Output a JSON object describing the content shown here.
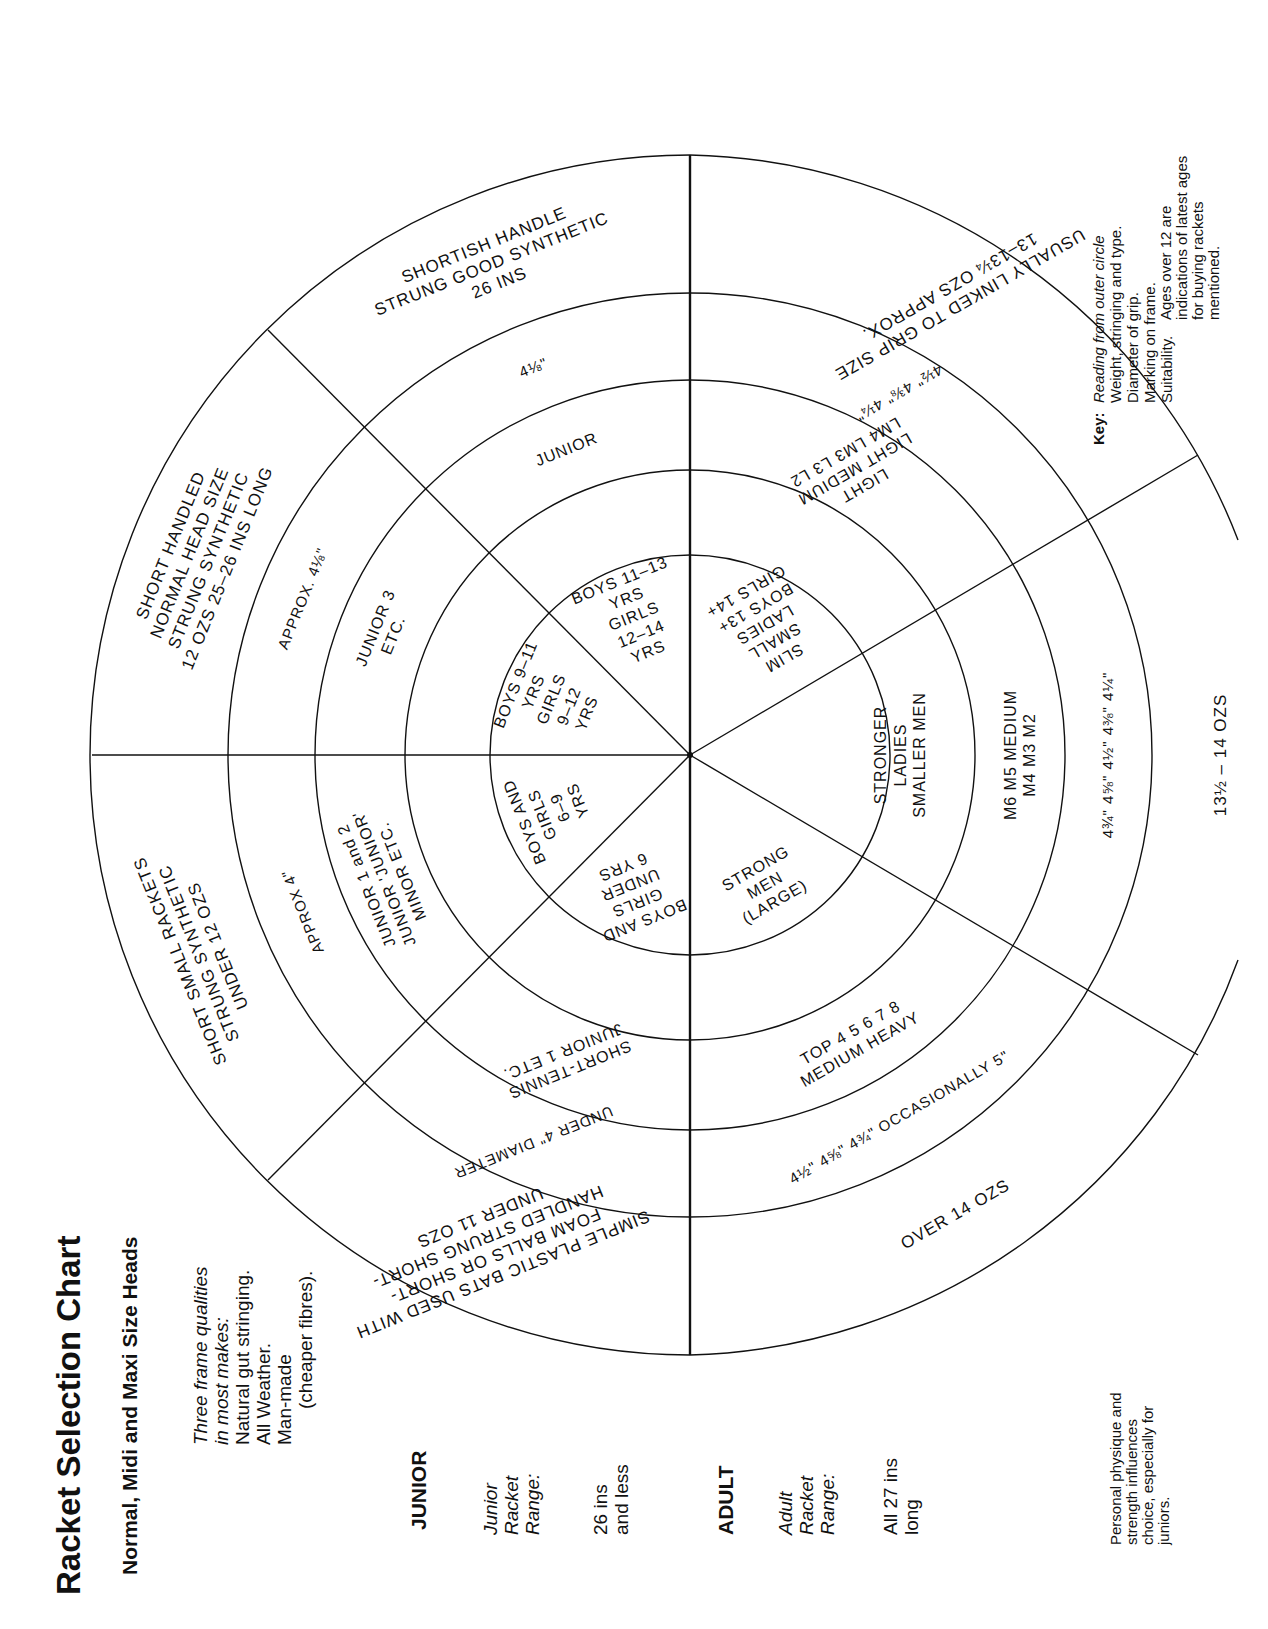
{
  "title": "Racket Selection Chart",
  "subtitle": "Normal, Midi and Maxi Size Heads",
  "frame_qualities": {
    "heading_line1": "Three frame qualities",
    "heading_line2": "in most makes:",
    "items": [
      "Natural gut stringing.",
      "All Weather.",
      "Man-made",
      "(cheaper fibres)."
    ]
  },
  "junior": {
    "heading": "JUNIOR",
    "range_label": [
      "Junior",
      "Racket",
      "Range:"
    ],
    "range_value": [
      "26 ins",
      "and less"
    ]
  },
  "adult": {
    "heading": "ADULT",
    "range_label": [
      "Adult",
      "Racket",
      "Range:"
    ],
    "range_value": [
      "All 27 ins",
      "long"
    ]
  },
  "key": {
    "label": "Key:",
    "lines": [
      "Reading from outer circle",
      "Weight, stringing and type.",
      "Diameter of grip.",
      "Marking on frame.",
      "Suitability."
    ]
  },
  "notes": {
    "ages": [
      "Ages over 12 are",
      "indications of latest ages",
      "for buying rackets",
      "mentioned."
    ],
    "physique": [
      "Personal physique and",
      "strength influences",
      "choice, especially for",
      "juniors."
    ]
  },
  "chart": {
    "rings": [
      "Weight, stringing and type",
      "Diameter of grip",
      "Marking on frame",
      "Suitability"
    ],
    "segments": [
      {
        "group": "junior",
        "weight": [
          "SHORTISH HANDLE",
          "STRUNG GOOD SYNTHETIC",
          "26 INS"
        ],
        "grip": "4⅛\"",
        "marking": "JUNIOR",
        "suitability": [
          "BOYS 11–13",
          "YRS",
          "GIRLS",
          "12–14",
          "YRS"
        ]
      },
      {
        "group": "junior",
        "weight": [
          "SHORT HANDLED",
          "NORMAL HEAD SIZE",
          "STRUNG SYNTHETIC",
          "12 OZS 25–26 INS LONG"
        ],
        "grip": "APPROX. 4⅛\"",
        "marking": [
          "JUNIOR 3",
          "ETC."
        ],
        "suitability": [
          "BOYS 9–11",
          "YRS",
          "GIRLS",
          "9–12",
          "YRS"
        ]
      },
      {
        "group": "junior",
        "weight": [
          "SHORT SMALL RACKETS",
          "STRUNG SYNTHETIC",
          "UNDER 12 OZS"
        ],
        "grip": "APPROX 4\"",
        "marking": [
          "JUNIOR 1 and 2",
          "JUNIOR 'JUNIOR'",
          "MINOR ETC."
        ],
        "suitability": [
          "BOYS AND",
          "GIRLS",
          "6–9",
          "YRS"
        ]
      },
      {
        "group": "junior",
        "weight": [
          "SIMPLE PLASTIC BATS USED WITH",
          "FOAM BALLS OR SHORT-",
          "HANDLED STRUNG SHORT-",
          "UNDER 11 OZS"
        ],
        "weight_alt": "HANDLED STRUNG RACKETS",
        "grip": "UNDER 4\" DIAMETER",
        "marking": [
          "SHORT-TENNIS",
          "JUNIOR 1 ETC."
        ],
        "suitability": [
          "BOYS AND",
          "GIRLS",
          "UNDER",
          "6 YRS"
        ]
      },
      {
        "group": "adult",
        "weight": [
          "OVER 14 OZS"
        ],
        "grip": "4½\"  4⅝\"  4¾\" OCCASIONALLY 5\"",
        "marking": [
          "TOP 4 5 6 7 8",
          "MEDIUM HEAVY"
        ],
        "suitability": [
          "STRONG",
          "MEN",
          "(LARGE)"
        ]
      },
      {
        "group": "adult",
        "weight": [
          "13½ – 14 OZS"
        ],
        "grip": "4¾\"  4⅝\"  4½\"  4⅜\"  4¼\"",
        "marking": [
          "M6  M5  MEDIUM",
          "M4  M3  M2"
        ],
        "suitability": [
          "STRONGER",
          "LADIES",
          "SMALLER MEN"
        ]
      },
      {
        "group": "adult",
        "weight": [
          "USUALLY LINKED TO GRIP SIZE",
          "13–13¼ OZS APPROX."
        ],
        "grip": "4½\"  4⅜\"  4¼\"",
        "marking": [
          "LIGHT",
          "LIGHT MEDIUM",
          "LM4  LM3  L3  L2"
        ],
        "suitability": [
          "SLIM",
          "SMALL",
          "LADIES",
          "BOYS 13+",
          "GIRLS 14+"
        ]
      }
    ]
  },
  "colors": {
    "ink": "#111111",
    "paper": "#ffffff"
  }
}
